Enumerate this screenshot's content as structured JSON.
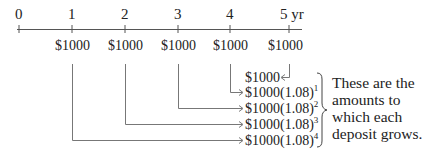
{
  "diagram": {
    "title": "",
    "axis": {
      "ticks": [
        {
          "label": "0",
          "x": 19
        },
        {
          "label": "1",
          "x": 72
        },
        {
          "label": "2",
          "x": 125
        },
        {
          "label": "3",
          "x": 178
        },
        {
          "label": "4",
          "x": 230
        },
        {
          "label": "5 yr",
          "x": 289
        }
      ]
    },
    "deposits": [
      {
        "year": "1",
        "label": "$1000"
      },
      {
        "year": "2",
        "label": "$1000"
      },
      {
        "year": "3",
        "label": "$1000"
      },
      {
        "year": "4",
        "label": "$1000"
      },
      {
        "year": "5",
        "label": "$1000"
      }
    ],
    "amounts": [
      {
        "base": "$1000",
        "exponent": ""
      },
      {
        "base": "$1000(1.08)",
        "exponent": "1"
      },
      {
        "base": "$1000(1.08)",
        "exponent": "2"
      },
      {
        "base": "$1000(1.08)",
        "exponent": "3"
      },
      {
        "base": "$1000(1.08)",
        "exponent": "4"
      }
    ],
    "note": {
      "lines": [
        "These are the",
        "amounts to",
        "which each",
        "deposit grows."
      ]
    },
    "colors": {
      "line": "#555555",
      "text": "#222222"
    }
  }
}
